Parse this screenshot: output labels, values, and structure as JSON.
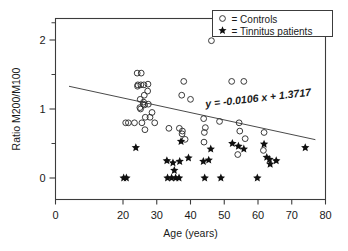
{
  "chart_data": {
    "type": "scatter",
    "title": "",
    "xlabel": "Age (years)",
    "ylabel": "Ratio M200/M100",
    "xlim": [
      0,
      80
    ],
    "ylim": [
      -0.18,
      2.35
    ],
    "xticks": [
      0,
      20,
      30,
      40,
      50,
      60,
      70,
      80
    ],
    "xtick_labels": [
      "0",
      "20",
      "30",
      "40",
      "50",
      "60",
      "70",
      "80"
    ],
    "yticks": [
      0,
      1,
      2
    ],
    "ytick_labels": [
      "0",
      "1",
      "2"
    ],
    "yticks_minor": [
      0.5,
      1.5,
      2.25
    ],
    "grid": false,
    "legend_position": "top-right",
    "legend": [
      {
        "marker": "open-circle",
        "symbol": "○",
        "label": "= Controls"
      },
      {
        "marker": "filled-star",
        "symbol": "★",
        "label": "= Tinnitus patients"
      }
    ],
    "annotations": [
      {
        "name": "regression-equation",
        "text": "y = -0.0106 x + 1.3717",
        "x": 44.5,
        "y": 1.02
      }
    ],
    "trendline": {
      "name": "regression-line",
      "slope": -0.0106,
      "intercept": 1.3717,
      "x_start": 4.0,
      "x_end": 77.0,
      "equation": "y = -0.0106 x + 1.3717"
    },
    "series": [
      {
        "name": "Controls",
        "marker": "open-circle",
        "points": [
          [
            20.8,
            0.8
          ],
          [
            21.6,
            0.8
          ],
          [
            23.4,
            0.8
          ],
          [
            24.2,
            1.52
          ],
          [
            24.3,
            1.33
          ],
          [
            24.4,
            1.35
          ],
          [
            25.4,
            1.52
          ],
          [
            25.3,
            1.35
          ],
          [
            25.1,
            1.14
          ],
          [
            25.2,
            1.0
          ],
          [
            25.0,
            1.02
          ],
          [
            25.6,
            0.8
          ],
          [
            26.2,
            1.35
          ],
          [
            26.3,
            1.2
          ],
          [
            26.1,
            1.1
          ],
          [
            26.4,
            1.06
          ],
          [
            26.0,
            1.07
          ],
          [
            26.6,
            0.88
          ],
          [
            26.5,
            0.7
          ],
          [
            27.4,
            1.36
          ],
          [
            27.3,
            1.26
          ],
          [
            27.5,
            1.07
          ],
          [
            28.0,
            0.88
          ],
          [
            28.6,
            0.95
          ],
          [
            29.4,
            0.8
          ],
          [
            33.6,
            0.72
          ],
          [
            36.7,
            0.72
          ],
          [
            37.6,
            0.68
          ],
          [
            37.4,
            1.2
          ],
          [
            37.5,
            0.64
          ],
          [
            38.0,
            1.4
          ],
          [
            38.4,
            0.56
          ],
          [
            40.0,
            1.14
          ],
          [
            43.9,
            0.86
          ],
          [
            44.1,
            0.66
          ],
          [
            44.0,
            0.52
          ],
          [
            46.2,
            1.99
          ],
          [
            44.4,
            0.73
          ],
          [
            48.6,
            0.82
          ],
          [
            52.2,
            1.4
          ],
          [
            54.0,
            0.34
          ],
          [
            54.4,
            0.8
          ],
          [
            54.6,
            0.68
          ],
          [
            55.8,
            1.4
          ],
          [
            56.2,
            0.57
          ],
          [
            61.6,
            0.4
          ],
          [
            61.8,
            0.66
          ]
        ]
      },
      {
        "name": "Tinnitus patients",
        "marker": "filled-star",
        "points": [
          [
            20.2,
            0.0
          ],
          [
            21.0,
            0.0
          ],
          [
            23.8,
            0.44
          ],
          [
            33.0,
            0.25
          ],
          [
            33.2,
            0.0
          ],
          [
            34.4,
            0.0
          ],
          [
            35.6,
            0.0
          ],
          [
            36.6,
            0.0
          ],
          [
            34.8,
            0.22
          ],
          [
            35.2,
            0.11
          ],
          [
            36.8,
            0.24
          ],
          [
            37.2,
            0.53
          ],
          [
            39.4,
            0.29
          ],
          [
            43.8,
            0.24
          ],
          [
            44.2,
            0.0
          ],
          [
            45.4,
            0.26
          ],
          [
            46.0,
            0.42
          ],
          [
            49.0,
            0.0
          ],
          [
            52.4,
            0.5
          ],
          [
            54.2,
            0.46
          ],
          [
            55.8,
            0.42
          ],
          [
            59.8,
            0.0
          ],
          [
            61.8,
            0.49
          ],
          [
            62.6,
            0.3
          ],
          [
            63.4,
            0.27
          ],
          [
            63.6,
            0.2
          ],
          [
            65.4,
            0.25
          ],
          [
            74.0,
            0.44
          ]
        ]
      }
    ]
  },
  "colors": {
    "axis": "#3c3c3c",
    "control_marker": "#303030",
    "patient_marker": "#101010",
    "trendline": "#4a4a4a",
    "text": "#1a1a1a",
    "background": "#ffffff"
  }
}
